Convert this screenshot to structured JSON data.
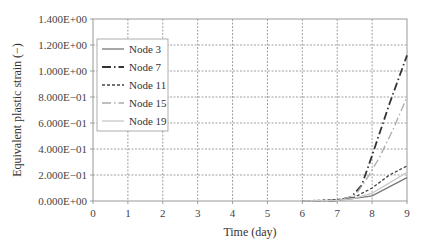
{
  "chart_data": {
    "type": "line",
    "title": "",
    "xlabel": "Time (day)",
    "ylabel": "Equivalent plastic strain (−)",
    "xlim": [
      0,
      9
    ],
    "ylim": [
      0,
      1.4
    ],
    "grid": true,
    "legend_position": "upper left (inside)",
    "x_ticks": [
      "0",
      "1",
      "2",
      "3",
      "4",
      "5",
      "6",
      "7",
      "8",
      "9"
    ],
    "y_ticks": [
      "0.000E+00",
      "2.000E−01",
      "4.000E−01",
      "6.000E−01",
      "8.000E−01",
      "1.000E+00",
      "1.200E+00",
      "1.400E+00"
    ],
    "series": [
      {
        "name": "Node 3",
        "style": "solid",
        "color": "#777777",
        "x": [
          6,
          7,
          7.5,
          8,
          9
        ],
        "values": [
          0.0,
          0.005,
          0.02,
          0.04,
          0.18
        ]
      },
      {
        "name": "Node 7",
        "style": "dash-dot",
        "color": "#333333",
        "x": [
          6.3,
          7,
          7.4,
          7.7,
          8,
          8.5,
          9
        ],
        "values": [
          0.0,
          0.005,
          0.03,
          0.12,
          0.35,
          0.75,
          1.12
        ]
      },
      {
        "name": "Node 11",
        "style": "dashed",
        "color": "#444444",
        "x": [
          6,
          7,
          7.5,
          8,
          8.5,
          9
        ],
        "values": [
          0.0,
          0.01,
          0.03,
          0.1,
          0.2,
          0.27
        ]
      },
      {
        "name": "Node 15",
        "style": "dash-dot",
        "color": "#aaaaaa",
        "x": [
          6.3,
          7,
          7.5,
          7.8,
          8.2,
          8.6,
          9
        ],
        "values": [
          0.0,
          0.005,
          0.04,
          0.15,
          0.33,
          0.55,
          0.8
        ]
      },
      {
        "name": "Node 19",
        "style": "solid",
        "color": "#c8c8c8",
        "x": [
          6,
          7,
          7.5,
          8,
          9
        ],
        "values": [
          0.0,
          0.005,
          0.02,
          0.06,
          0.22
        ]
      }
    ]
  }
}
